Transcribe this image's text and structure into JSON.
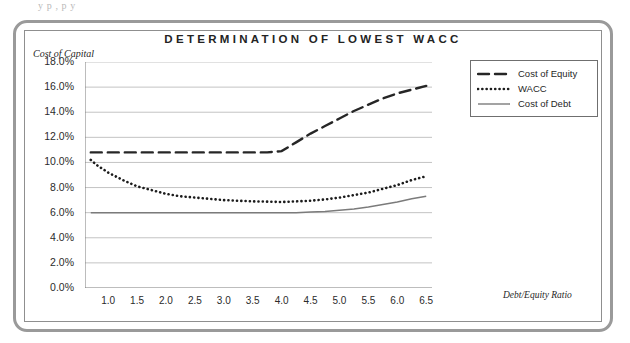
{
  "page": {
    "top_bleed_text": "y    p         ,            p y"
  },
  "chart": {
    "title": "DETERMINATION OF LOWEST WACC",
    "y_axis_title": "Cost of Capital",
    "x_axis_title": "Debt/Equity Ratio"
  },
  "legend": {
    "position": "top-right",
    "items": [
      {
        "label": "Cost of Equity",
        "style": "dashed",
        "color": "#262626"
      },
      {
        "label": "WACC",
        "style": "dotted",
        "color": "#1c1c1c"
      },
      {
        "label": "Cost of Debt",
        "style": "solid",
        "color": "#7b7b7b"
      }
    ]
  },
  "chart_data": {
    "type": "line",
    "title": "DETERMINATION OF LOWEST WACC",
    "xlabel": "Debt/Equity Ratio",
    "ylabel": "Cost of Capital",
    "xlim": [
      0.6,
      6.6
    ],
    "ylim": [
      0.0,
      18.0
    ],
    "grid": true,
    "y_unit": "%",
    "yticks": [
      "0.0%",
      "2.0%",
      "4.0%",
      "6.0%",
      "8.0%",
      "10.0%",
      "12.0%",
      "14.0%",
      "16.0%",
      "18.0%"
    ],
    "ytick_values": [
      0.0,
      2.0,
      4.0,
      6.0,
      8.0,
      10.0,
      12.0,
      14.0,
      16.0,
      18.0
    ],
    "xticks": [
      "1.0",
      "1.5",
      "2.0",
      "2.5",
      "3.0",
      "3.5",
      "4.0",
      "4.5",
      "5.0",
      "5.5",
      "6.0",
      "6.5"
    ],
    "xtick_values": [
      1.0,
      1.5,
      2.0,
      2.5,
      3.0,
      3.5,
      4.0,
      4.5,
      5.0,
      5.5,
      6.0,
      6.5
    ],
    "x": [
      0.7,
      0.8,
      1.0,
      1.25,
      1.5,
      1.75,
      2.0,
      2.25,
      2.5,
      2.75,
      3.0,
      3.25,
      3.5,
      3.75,
      4.0,
      4.25,
      4.5,
      4.75,
      5.0,
      5.25,
      5.5,
      5.75,
      6.0,
      6.25,
      6.5
    ],
    "series": [
      {
        "name": "Cost of Equity",
        "style": "dashed",
        "color": "#262626",
        "values": [
          10.8,
          10.8,
          10.8,
          10.8,
          10.8,
          10.8,
          10.8,
          10.8,
          10.8,
          10.8,
          10.8,
          10.8,
          10.8,
          10.8,
          10.9,
          11.6,
          12.3,
          12.9,
          13.5,
          14.1,
          14.6,
          15.1,
          15.5,
          15.8,
          16.1
        ]
      },
      {
        "name": "WACC",
        "style": "dotted",
        "color": "#1c1c1c",
        "values": [
          10.2,
          9.8,
          9.2,
          8.6,
          8.1,
          7.8,
          7.5,
          7.3,
          7.2,
          7.1,
          7.0,
          6.95,
          6.9,
          6.88,
          6.85,
          6.9,
          6.95,
          7.05,
          7.2,
          7.4,
          7.6,
          7.9,
          8.2,
          8.6,
          8.9
        ]
      },
      {
        "name": "Cost of Debt",
        "style": "solid",
        "color": "#7b7b7b",
        "values": [
          6.0,
          6.0,
          6.0,
          6.0,
          6.0,
          6.0,
          6.0,
          6.0,
          6.0,
          6.0,
          6.0,
          6.0,
          6.0,
          6.0,
          6.0,
          6.0,
          6.05,
          6.1,
          6.2,
          6.3,
          6.45,
          6.65,
          6.85,
          7.1,
          7.3
        ]
      }
    ],
    "annotations": []
  }
}
